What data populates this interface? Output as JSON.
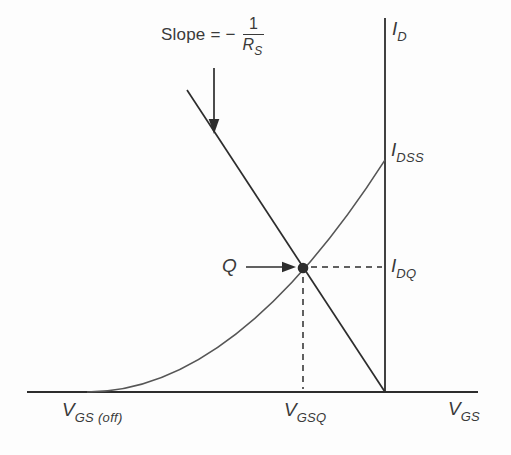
{
  "figure": {
    "slope_label": {
      "prefix": "Slope = −",
      "numerator": "1",
      "denominator_base": "R",
      "denominator_sub": "S"
    },
    "axis_labels": {
      "y_base": "I",
      "y_sub": "D",
      "x_base": "V",
      "x_sub": "GS"
    },
    "point_labels": {
      "idss_base": "I",
      "idss_sub": "DSS",
      "idq_base": "I",
      "idq_sub": "DQ",
      "q": "Q",
      "vgsoff_base": "V",
      "vgsoff_sub": "GS (off)",
      "vgsq_base": "V",
      "vgsq_sub": "GSQ"
    },
    "colors": {
      "line": "#2d2d2d",
      "curve": "#565656",
      "text": "#3a3a3a",
      "background": "#fdfdfd"
    }
  }
}
